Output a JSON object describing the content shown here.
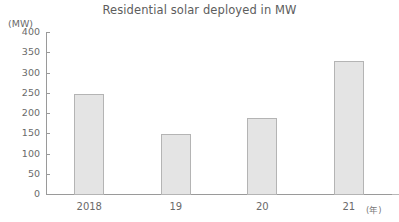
{
  "chart_data": {
    "type": "bar",
    "title": "Residential solar deployed in MW",
    "xlabel": "",
    "ylabel": "(MW)",
    "unit_label": "(MW)",
    "x_axis_suffix": "(年)",
    "categories": [
      "2018",
      "19",
      "20",
      "21"
    ],
    "values": [
      250,
      150,
      190,
      330
    ],
    "series": [
      {
        "name": "Residential solar deployed",
        "values": [
          250,
          150,
          190,
          330
        ]
      }
    ],
    "ylim": [
      0,
      400
    ],
    "y_ticks": [
      0,
      50,
      100,
      150,
      200,
      250,
      300,
      350,
      400
    ],
    "y_tick_labels": [
      "0",
      "50",
      "100",
      "150",
      "200",
      "250",
      "300",
      "350",
      "400"
    ],
    "grid": false,
    "legend": false,
    "legend_position": "none",
    "colors": {
      "bar_fill": "#e4e4e4",
      "bar_border": "#b4b4b4",
      "axis": "#9a9a9a",
      "text": "#6a6a6a",
      "title_text": "#5d5d5d",
      "background": "#ffffff"
    }
  }
}
